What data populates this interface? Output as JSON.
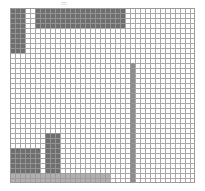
{
  "figure": {
    "background_color": "#ffffff",
    "top_artifact_glyph": "▭",
    "plot": {
      "left": 10,
      "top": 8,
      "width": 185,
      "height": 175,
      "cell_size": 5,
      "columns": 37,
      "rows": 35,
      "grid_visible": true,
      "grid_color": "#9a9a9a",
      "border_color": "#9a9a9a"
    }
  },
  "chart_data": {
    "type": "heatmap",
    "title": "",
    "subtitle": "",
    "xlabel": "",
    "ylabel": "",
    "xlim": [
      0,
      37
    ],
    "ylim": [
      0,
      35
    ],
    "xticklabels": [],
    "yticklabels": [],
    "grid": true,
    "legend": null,
    "cell_size_px": 5,
    "columns": 37,
    "rows": 35,
    "empty_cell_color": "#ffffff",
    "value_colors": {
      "0": "#ffffff",
      "1": "#b0b0b0",
      "2": "#8c8c8c",
      "3": "#6e6e6e"
    },
    "blocks": [
      {
        "name": "top-horizontal-bar",
        "col": 5,
        "row": 0,
        "width": 18,
        "height": 4,
        "value": 3,
        "color": "#6e6e6e"
      },
      {
        "name": "left-vertical-bar",
        "col": 0,
        "row": 0,
        "width": 3,
        "height": 9,
        "value": 3,
        "color": "#6e6e6e"
      },
      {
        "name": "mid-vertical-bar",
        "col": 7,
        "row": 25,
        "width": 3,
        "height": 8,
        "value": 3,
        "color": "#6e6e6e"
      },
      {
        "name": "bottom-left-horizontal-bar",
        "col": 0,
        "row": 28,
        "width": 6,
        "height": 5,
        "value": 3,
        "color": "#6e6e6e"
      },
      {
        "name": "tall-vertical-bar",
        "col": 24,
        "row": 11,
        "width": 1,
        "height": 24,
        "value": 2,
        "color": "#8c8c8c"
      },
      {
        "name": "bottom-baseline-bar",
        "col": 0,
        "row": 33,
        "width": 20,
        "height": 2,
        "value": 1,
        "color": "#b0b0b0"
      }
    ],
    "annotations": []
  }
}
